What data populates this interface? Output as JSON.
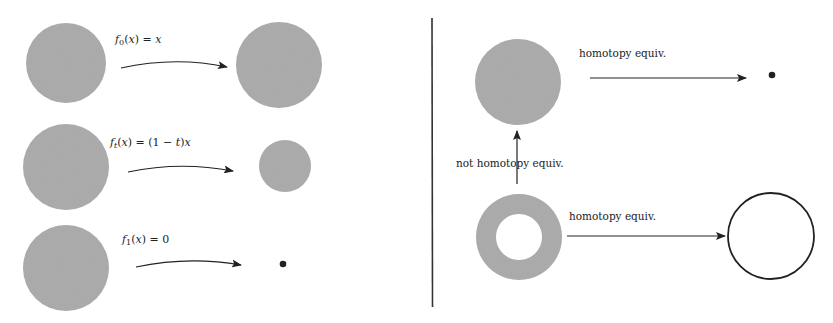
{
  "colors": {
    "fill_gray": "#a8a8a8",
    "stroke": "#222222",
    "background": "#ffffff"
  },
  "left_panel": {
    "rows": [
      {
        "label_func": "f",
        "label_sub": "0",
        "label_rest_a": "(",
        "label_var": "x",
        "label_rest_b": ") = ",
        "label_rhs": "x",
        "source_shape": "disk",
        "target_shape": "disk-large",
        "arrow": "curved-arrow"
      },
      {
        "label_func": "f",
        "label_sub": "t",
        "label_rest_a": "(",
        "label_var": "x",
        "label_rest_b": ") = (1 − ",
        "label_rhs_t": "t",
        "label_rhs_close": ")",
        "label_rhs": "x",
        "source_shape": "disk",
        "target_shape": "disk-small",
        "arrow": "curved-arrow"
      },
      {
        "label_func": "f",
        "label_sub": "1",
        "label_rest_a": "(",
        "label_var": "x",
        "label_rest_b": ") = ",
        "label_rhs": "0",
        "source_shape": "disk",
        "target_shape": "point",
        "arrow": "curved-arrow"
      }
    ]
  },
  "right_panel": {
    "top_arrow_label": "homotopy equiv.",
    "vertical_arrow_label": "not homotopy equiv.",
    "bottom_arrow_label": "homotopy equiv.",
    "top_source_shape": "disk",
    "top_target_shape": "point",
    "bottom_source_shape": "annulus",
    "bottom_target_shape": "circle"
  }
}
